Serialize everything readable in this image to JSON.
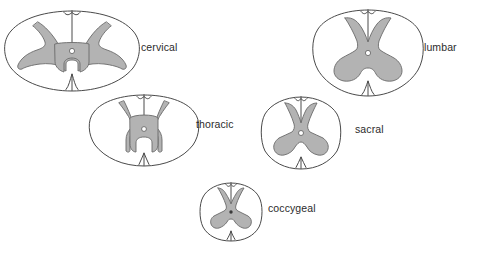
{
  "figure": {
    "background_color": "#ffffff",
    "outline_color": "#4a4a4a",
    "gray_matter_color": "#b3b3b3",
    "gray_matter_stroke": "#6a6a6a",
    "label_color": "#2b2b2b"
  },
  "sections": [
    {
      "id": "cervical",
      "label": "cervical",
      "label_x": 141,
      "label_y": 51,
      "center_x": 72,
      "center_y": 52,
      "width": 125,
      "height": 82,
      "shape": "wide-oval",
      "canal_type": "ring",
      "description": "Largest diameter, oval and widest transversely; large gray matter with broad ventral horns"
    },
    {
      "id": "thoracic",
      "label": "thoracic",
      "label_x": 196,
      "label_y": 128,
      "center_x": 144,
      "center_y": 130,
      "width": 100,
      "height": 72,
      "shape": "round-oval",
      "canal_type": "ring",
      "description": "Small round cord with slender gray matter and thin lateral horns"
    },
    {
      "id": "lumbar",
      "label": "lumbar",
      "label_x": 424,
      "label_y": 51,
      "center_x": 368,
      "center_y": 53,
      "width": 100,
      "height": 86,
      "shape": "round",
      "canal_type": "ring",
      "description": "Nearly circular with large, bulky anterior and posterior gray horns"
    },
    {
      "id": "sacral",
      "label": "sacral",
      "label_x": 355,
      "label_y": 133,
      "center_x": 301,
      "center_y": 133,
      "width": 72,
      "height": 72,
      "shape": "round",
      "canal_type": "ring",
      "description": "Small round cord with proportionally very large gray matter"
    },
    {
      "id": "coccygeal",
      "label": "coccygeal",
      "label_x": 268,
      "label_y": 212,
      "center_x": 231,
      "center_y": 212,
      "width": 58,
      "height": 58,
      "shape": "round",
      "canal_type": "dot",
      "description": "Smallest section, almost entirely gray matter"
    }
  ]
}
